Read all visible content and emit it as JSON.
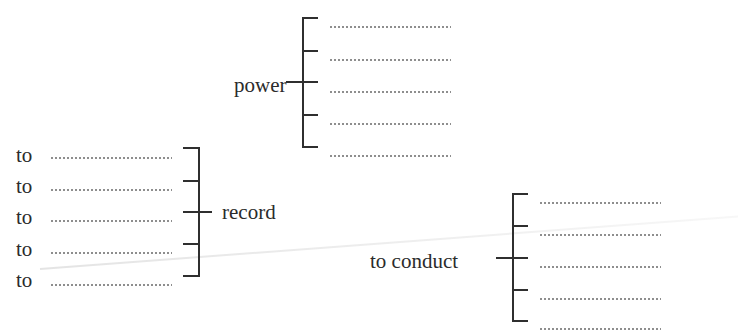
{
  "exercise": {
    "power_diagram": {
      "keyword": "power",
      "blanks": [
        "",
        "",
        "",
        "",
        ""
      ]
    },
    "record_diagram": {
      "keyword": "record",
      "prefixes": [
        "to",
        "to",
        "to",
        "to",
        "to"
      ],
      "blanks": [
        "",
        "",
        "",
        "",
        ""
      ]
    },
    "conduct_diagram": {
      "keyword": "to conduct",
      "blanks": [
        "",
        "",
        "",
        "",
        ""
      ]
    }
  }
}
